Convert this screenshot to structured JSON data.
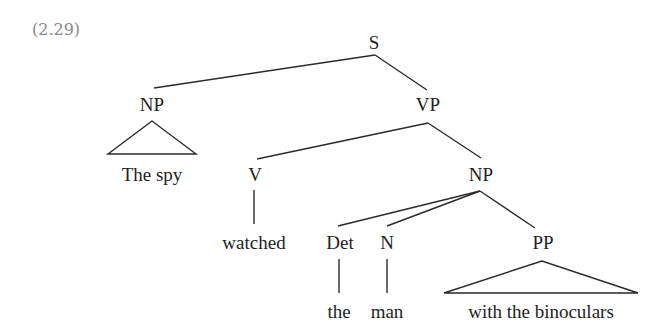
{
  "example_number": "(2.29)",
  "tree": {
    "nodes": {
      "S": "S",
      "NP_subj": "NP",
      "VP": "VP",
      "V": "V",
      "NP_obj": "NP",
      "Det": "Det",
      "N": "N",
      "PP": "PP"
    },
    "leaves": {
      "subj": "The spy",
      "verb": "watched",
      "det": "the",
      "noun": "man",
      "pp": "with the binoculars"
    }
  },
  "colors": {
    "text": "#1e1e1e",
    "line": "#2a2a2a",
    "example_number": "#8a8a8a",
    "background": "#ffffff"
  }
}
